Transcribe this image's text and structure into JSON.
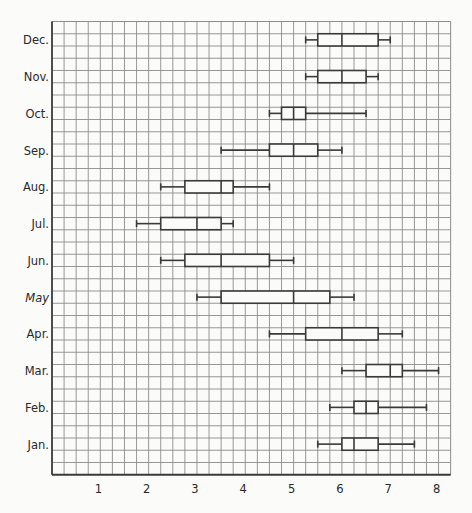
{
  "chart_data": {
    "type": "boxplot",
    "orientation": "horizontal",
    "title": "",
    "xlabel": "",
    "ylabel": "",
    "xlim": [
      0,
      8.25
    ],
    "x_ticks": [
      1,
      2,
      3,
      4,
      5,
      6,
      7,
      8
    ],
    "grid": true,
    "grid_minor_step": 0.25,
    "legend": null,
    "categories": [
      "Dec.",
      "Nov.",
      "Oct.",
      "Sep.",
      "Aug.",
      "Jul.",
      "Jun.",
      "May",
      "Apr.",
      "Mar.",
      "Feb.",
      "Jan."
    ],
    "series": [
      {
        "label": "Dec.",
        "min": 5.25,
        "q1": 5.5,
        "median": 6.0,
        "q3": 6.75,
        "max": 7.0
      },
      {
        "label": "Nov.",
        "min": 5.25,
        "q1": 5.5,
        "median": 6.0,
        "q3": 6.5,
        "max": 6.75
      },
      {
        "label": "Oct.",
        "min": 4.5,
        "q1": 4.75,
        "median": 5.0,
        "q3": 5.25,
        "max": 6.5
      },
      {
        "label": "Sep.",
        "min": 3.5,
        "q1": 4.5,
        "median": 5.0,
        "q3": 5.5,
        "max": 6.0
      },
      {
        "label": "Aug.",
        "min": 2.25,
        "q1": 2.75,
        "median": 3.5,
        "q3": 3.75,
        "max": 4.5
      },
      {
        "label": "Jul.",
        "min": 1.75,
        "q1": 2.25,
        "median": 3.0,
        "q3": 3.5,
        "max": 3.75
      },
      {
        "label": "Jun.",
        "min": 2.25,
        "q1": 2.75,
        "median": 3.5,
        "q3": 4.5,
        "max": 5.0
      },
      {
        "label": "May",
        "min": 3.0,
        "q1": 3.5,
        "median": 5.0,
        "q3": 5.75,
        "max": 6.25
      },
      {
        "label": "Apr.",
        "min": 4.5,
        "q1": 5.25,
        "median": 6.0,
        "q3": 6.75,
        "max": 7.25
      },
      {
        "label": "Mar.",
        "min": 6.0,
        "q1": 6.5,
        "median": 7.0,
        "q3": 7.25,
        "max": 8.0
      },
      {
        "label": "Feb.",
        "min": 5.75,
        "q1": 6.25,
        "median": 6.5,
        "q3": 6.75,
        "max": 7.75
      },
      {
        "label": "Jan.",
        "min": 5.5,
        "q1": 6.0,
        "median": 6.25,
        "q3": 6.75,
        "max": 7.5
      }
    ]
  },
  "colors": {
    "background": "#fbfbfa",
    "grid": "#8c8c8c",
    "axis": "#3a3a3a",
    "box_stroke": "#3a3a3a",
    "box_fill": "#fbfbfa",
    "text": "#2a2a2a"
  }
}
